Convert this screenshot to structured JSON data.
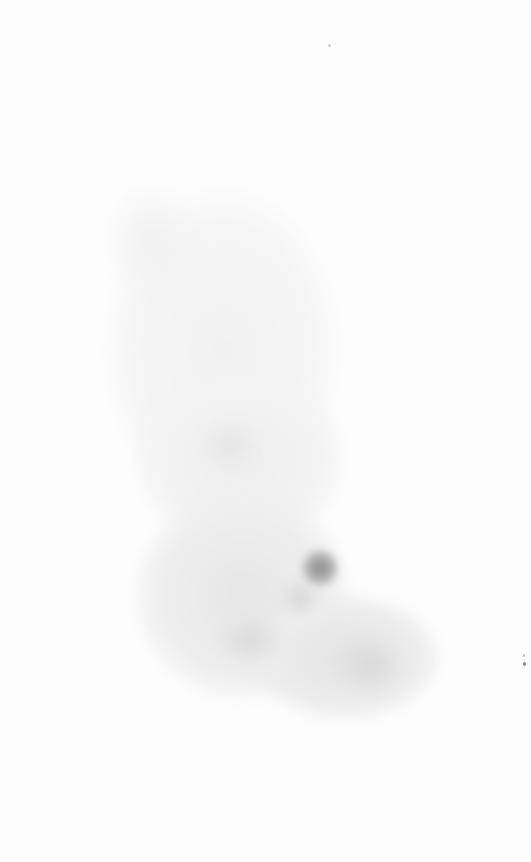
{
  "image": {
    "description": "Faint grayscale cloud-like texture on white background forming an L/boot-shaped region with a darker spot near the lower middle",
    "background_color": "#fdfdfd",
    "texture_colors": [
      "#f3f3f3",
      "#ececec",
      "#e2e2e2",
      "#9a9a9a"
    ],
    "regions": [
      {
        "name": "upper-column",
        "x": 105,
        "y": 190,
        "w": 235,
        "h": 320,
        "color": "#f2f2f2"
      },
      {
        "name": "mid-column",
        "x": 140,
        "y": 380,
        "w": 200,
        "h": 160,
        "color": "#efefef"
      },
      {
        "name": "lower-body",
        "x": 140,
        "y": 500,
        "w": 200,
        "h": 190,
        "color": "#e9e9e9"
      },
      {
        "name": "foot-extension",
        "x": 260,
        "y": 600,
        "w": 175,
        "h": 115,
        "color": "#e6e6e6"
      },
      {
        "name": "dark-spot",
        "x": 303,
        "y": 552,
        "w": 32,
        "h": 32,
        "color": "#9c9c9c"
      },
      {
        "name": "shade-1",
        "x": 285,
        "y": 585,
        "w": 30,
        "h": 25,
        "color": "#d8d8d8"
      },
      {
        "name": "shade-2",
        "x": 220,
        "y": 620,
        "w": 60,
        "h": 40,
        "color": "#dedede"
      },
      {
        "name": "shade-3",
        "x": 340,
        "y": 640,
        "w": 60,
        "h": 50,
        "color": "#dcdcdc"
      }
    ]
  }
}
